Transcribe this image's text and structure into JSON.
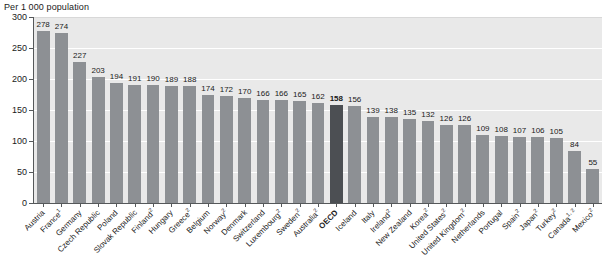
{
  "chart": {
    "axis_title": "Per 1 000 population",
    "yaxis": {
      "ticks": [
        "0",
        "50",
        "100",
        "150",
        "200",
        "250",
        "300"
      ],
      "min": 0,
      "max": 300
    }
  },
  "chart_data": {
    "type": "bar",
    "title": "Per 1 000 population",
    "xlabel": "",
    "ylabel": "Per 1 000 population",
    "ylim": [
      0,
      300
    ],
    "yticks": [
      0,
      50,
      100,
      150,
      200,
      250,
      300
    ],
    "grid": true,
    "legend": "none",
    "highlight_category": "OECD",
    "colors": {
      "bar": "#8d9094",
      "highlight_bar": "#4c4f53",
      "plot_background": "#e9e9e9",
      "gridline": "#ffffff",
      "axis": "#55585a"
    },
    "categories": [
      "Austria",
      "France",
      "Germany",
      "Czech Republic",
      "Poland",
      "Slovak Republic",
      "Finland",
      "Hungary",
      "Greece",
      "Belgium",
      "Norway",
      "Denmark",
      "Switzerland",
      "Luxembourg",
      "Sweden",
      "Australia",
      "OECD",
      "Iceland",
      "Italy",
      "Ireland",
      "New Zealand",
      "Korea",
      "United States",
      "United Kingdom",
      "Netherlands",
      "Portugal",
      "Spain",
      "Japan",
      "Turkey",
      "Canada",
      "Mexico"
    ],
    "category_footnotes": [
      "",
      "1",
      "",
      "",
      "",
      "",
      "2",
      "",
      "2",
      "",
      "2",
      "",
      "",
      "2",
      "2",
      "2",
      "",
      "",
      "",
      "2",
      "",
      "2",
      "2",
      "2",
      "",
      "",
      "2",
      "2",
      "2",
      "1, 2",
      "2"
    ],
    "values": [
      278,
      274,
      227,
      203,
      194,
      191,
      190,
      189,
      188,
      174,
      172,
      170,
      166,
      166,
      165,
      162,
      158,
      156,
      139,
      138,
      135,
      132,
      126,
      126,
      109,
      108,
      107,
      106,
      105,
      84,
      55
    ]
  }
}
